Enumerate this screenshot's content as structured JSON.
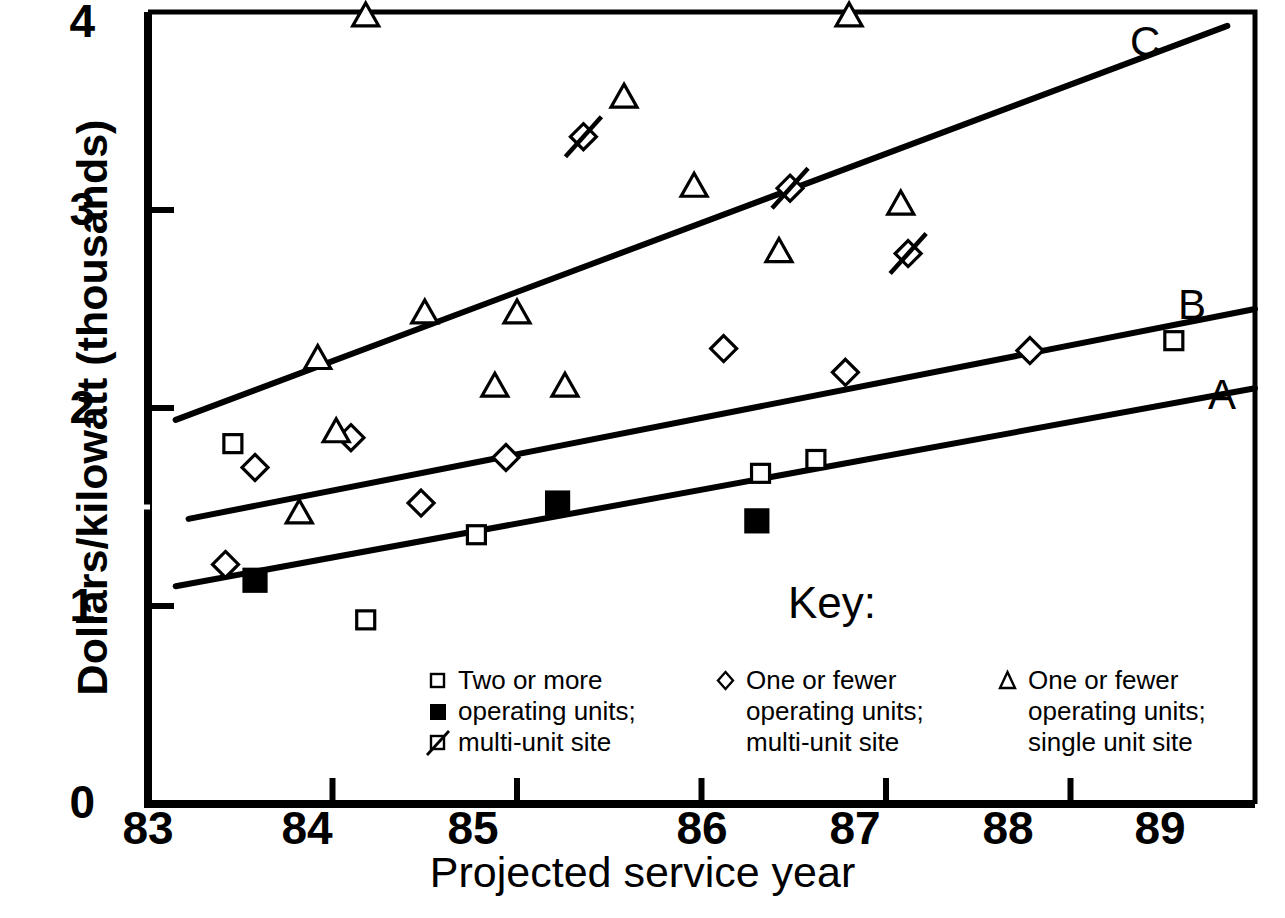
{
  "chart": {
    "ylabel": "Dollars/kilowatt (thousands)",
    "xlabel": "Projected service year",
    "key_title": "Key:",
    "yticks": [
      "0",
      "1",
      "2",
      "3",
      "4"
    ],
    "xticks": [
      "83",
      "84",
      "85",
      "86",
      "87",
      "88",
      "89"
    ],
    "line_labels": {
      "a": "A",
      "b": "B",
      "c": "C"
    },
    "legend": [
      {
        "markers": [
          "open-square",
          "filled-square",
          "slashed-square"
        ],
        "lines": [
          "Two or more",
          "operating units;",
          "multi-unit site"
        ]
      },
      {
        "markers": [
          "open-diamond",
          "",
          ""
        ],
        "lines": [
          "One or fewer",
          "operating units;",
          "multi-unit site"
        ]
      },
      {
        "markers": [
          "open-triangle",
          "",
          ""
        ],
        "lines": [
          "One or fewer",
          "operating units;",
          "single unit site"
        ]
      }
    ]
  },
  "chart_data": {
    "type": "scatter",
    "title": "",
    "xlabel": "Projected service year",
    "ylabel": "Dollars/kilowatt (thousands)",
    "xlim": [
      83,
      89
    ],
    "ylim": [
      0,
      4
    ],
    "xticks": [
      83,
      84,
      85,
      86,
      87,
      88,
      89
    ],
    "yticks": [
      0,
      1,
      2,
      3,
      4
    ],
    "grid": false,
    "legend_position": "bottom-center",
    "series": [
      {
        "name": "Two or more operating units; multi-unit site",
        "marker": "open-square",
        "points": [
          [
            83.46,
            1.82
          ],
          [
            84.18,
            0.93
          ],
          [
            84.78,
            1.36
          ],
          [
            86.32,
            1.67
          ],
          [
            86.62,
            1.74
          ],
          [
            88.56,
            2.34
          ]
        ]
      },
      {
        "name": "Two or more operating units; multi-unit site (filled)",
        "marker": "filled-square",
        "points": [
          [
            83.58,
            1.13
          ],
          [
            85.22,
            1.52
          ],
          [
            86.3,
            1.43
          ]
        ]
      },
      {
        "name": "One or fewer operating units; multi-unit site",
        "marker": "open-diamond",
        "points": [
          [
            83.58,
            1.7
          ],
          [
            84.1,
            1.85
          ],
          [
            83.42,
            1.21
          ],
          [
            84.48,
            1.52
          ],
          [
            84.94,
            1.75
          ],
          [
            86.12,
            2.3
          ],
          [
            86.78,
            2.18
          ],
          [
            87.78,
            2.29
          ]
        ]
      },
      {
        "name": "One or fewer operating units; single unit site",
        "marker": "open-triangle",
        "points": [
          [
            83.82,
            1.47
          ],
          [
            83.92,
            2.25
          ],
          [
            84.02,
            1.88
          ],
          [
            84.5,
            2.48
          ],
          [
            84.88,
            2.11
          ],
          [
            85.0,
            2.48
          ],
          [
            85.26,
            2.11
          ],
          [
            84.18,
            3.98
          ],
          [
            85.58,
            3.57
          ],
          [
            85.96,
            3.12
          ],
          [
            86.42,
            2.79
          ],
          [
            86.8,
            3.98
          ],
          [
            87.08,
            3.03
          ]
        ]
      },
      {
        "name": "Slashed (multi-unit site, combined)",
        "marker": "slashed-diamond",
        "points": [
          [
            85.36,
            3.37
          ],
          [
            86.48,
            3.11
          ],
          [
            87.12,
            2.78
          ]
        ]
      }
    ],
    "trend_lines": [
      {
        "label": "A",
        "x": [
          83.15,
          89.0
        ],
        "y": [
          1.1,
          2.1
        ]
      },
      {
        "label": "B",
        "x": [
          83.22,
          89.0
        ],
        "y": [
          1.44,
          2.5
        ]
      },
      {
        "label": "C",
        "x": [
          83.15,
          88.85
        ],
        "y": [
          1.94,
          3.93
        ]
      }
    ]
  }
}
